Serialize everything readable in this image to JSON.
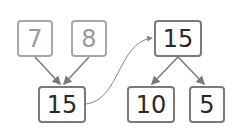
{
  "diagram": {
    "left_tree": {
      "inputs": [
        {
          "value": "7"
        },
        {
          "value": "8"
        }
      ],
      "result": {
        "value": "15"
      }
    },
    "right_tree": {
      "root": {
        "value": "15"
      },
      "parts": [
        {
          "value": "10"
        },
        {
          "value": "5"
        }
      ]
    },
    "colors": {
      "input_text": "#9a9a9a",
      "result_text": "#2a2a2a",
      "box_border": "#8a8a8a",
      "arrow": "#7a7a7a"
    }
  }
}
